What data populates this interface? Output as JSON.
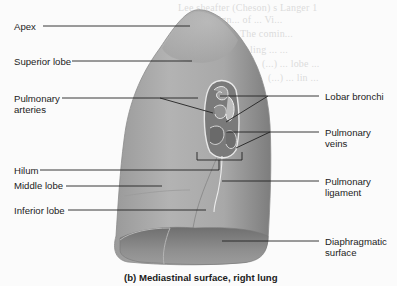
{
  "figure": {
    "caption": "(b) Mediastinal surface, right lung",
    "colors": {
      "background": "#fbfbfb",
      "lung_surface": "#a6a6a6",
      "lung_shadow": "#6e6e6e",
      "diaphragmatic_surface": "#8a8a8a",
      "hilum_cavity": "#7c7c7c",
      "leader_line": "#222222",
      "label_text": "#1b1b1b",
      "bleed_text": "#dcdcdc"
    }
  },
  "labels_left": [
    {
      "id": "apex",
      "text": "Apex"
    },
    {
      "id": "superior-lobe",
      "text": "Superior lobe"
    },
    {
      "id": "pulmonary-arteries",
      "text": "Pulmonary",
      "text2": "arteries"
    },
    {
      "id": "hilum",
      "text": "Hilum"
    },
    {
      "id": "middle-lobe",
      "text": "Middle lobe"
    },
    {
      "id": "inferior-lobe",
      "text": "Inferior lobe"
    }
  ],
  "labels_right": [
    {
      "id": "lobar-bronchi",
      "text": "Lobar bronchi"
    },
    {
      "id": "pulmonary-veins",
      "text": "Pulmonary",
      "text2": "veins"
    },
    {
      "id": "pulmonary-ligament",
      "text": "Pulmonary",
      "text2": "ligament"
    },
    {
      "id": "diaphragmatic-surface",
      "text": "Diaphragmatic",
      "text2": "surface"
    }
  ],
  "bleed_through": [
    "Lee sheafter (Cheson) s Langer 1",
    "Lu sign... of ... Vi...",
    "The comin...",
    "ling ... ...",
    "(...) ... lobe ...",
    "(...) ... lin ..."
  ]
}
